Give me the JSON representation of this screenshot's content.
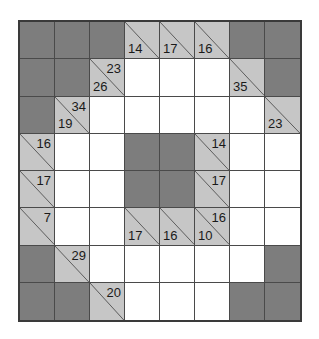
{
  "puzzle": {
    "type": "kakuro",
    "rows": 8,
    "cols": 8,
    "colors": {
      "block": "#7d7d7d",
      "clue": "#c6c6c6",
      "empty": "#ffffff",
      "line": "#4a4a4a",
      "border": "#3a3a3a",
      "text": "#1a1a1a"
    },
    "cells": [
      [
        {
          "kind": "block"
        },
        {
          "kind": "block"
        },
        {
          "kind": "block"
        },
        {
          "kind": "clue",
          "down": "14"
        },
        {
          "kind": "clue",
          "down": "17"
        },
        {
          "kind": "clue",
          "down": "16"
        },
        {
          "kind": "block"
        },
        {
          "kind": "block"
        }
      ],
      [
        {
          "kind": "block"
        },
        {
          "kind": "block"
        },
        {
          "kind": "clue",
          "across": "23",
          "down": "26"
        },
        {
          "kind": "empty"
        },
        {
          "kind": "empty"
        },
        {
          "kind": "empty"
        },
        {
          "kind": "clue",
          "down": "35"
        },
        {
          "kind": "block"
        }
      ],
      [
        {
          "kind": "block"
        },
        {
          "kind": "clue",
          "across": "34",
          "down": "19"
        },
        {
          "kind": "empty"
        },
        {
          "kind": "empty"
        },
        {
          "kind": "empty"
        },
        {
          "kind": "empty"
        },
        {
          "kind": "empty"
        },
        {
          "kind": "clue",
          "down": "23"
        }
      ],
      [
        {
          "kind": "clue",
          "across": "16"
        },
        {
          "kind": "empty"
        },
        {
          "kind": "empty"
        },
        {
          "kind": "block"
        },
        {
          "kind": "block"
        },
        {
          "kind": "clue",
          "across": "14"
        },
        {
          "kind": "empty"
        },
        {
          "kind": "empty"
        }
      ],
      [
        {
          "kind": "clue",
          "across": "17"
        },
        {
          "kind": "empty"
        },
        {
          "kind": "empty"
        },
        {
          "kind": "block"
        },
        {
          "kind": "block"
        },
        {
          "kind": "clue",
          "across": "17"
        },
        {
          "kind": "empty"
        },
        {
          "kind": "empty"
        }
      ],
      [
        {
          "kind": "clue",
          "across": "7"
        },
        {
          "kind": "empty"
        },
        {
          "kind": "empty"
        },
        {
          "kind": "clue",
          "down": "17"
        },
        {
          "kind": "clue",
          "down": "16"
        },
        {
          "kind": "clue",
          "across": "16",
          "down": "10"
        },
        {
          "kind": "empty"
        },
        {
          "kind": "empty"
        }
      ],
      [
        {
          "kind": "block"
        },
        {
          "kind": "clue",
          "across": "29"
        },
        {
          "kind": "empty"
        },
        {
          "kind": "empty"
        },
        {
          "kind": "empty"
        },
        {
          "kind": "empty"
        },
        {
          "kind": "empty"
        },
        {
          "kind": "block"
        }
      ],
      [
        {
          "kind": "block"
        },
        {
          "kind": "block"
        },
        {
          "kind": "clue",
          "across": "20"
        },
        {
          "kind": "empty"
        },
        {
          "kind": "empty"
        },
        {
          "kind": "empty"
        },
        {
          "kind": "block"
        },
        {
          "kind": "block"
        }
      ]
    ]
  }
}
